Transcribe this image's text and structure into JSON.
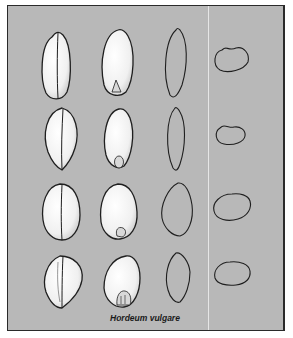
{
  "figure": {
    "caption": "Hordeum vulgare",
    "columns": [
      "ventral-view",
      "dorsal-view",
      "lateral-outline",
      "cross-section-outline"
    ],
    "rows": 4,
    "colors": {
      "background": "#b8b8b8",
      "border": "#2a2a2a",
      "outline": "#1f1f1f",
      "grain_fill": "#f4f4f4",
      "divider": "#e6e6e6"
    }
  }
}
